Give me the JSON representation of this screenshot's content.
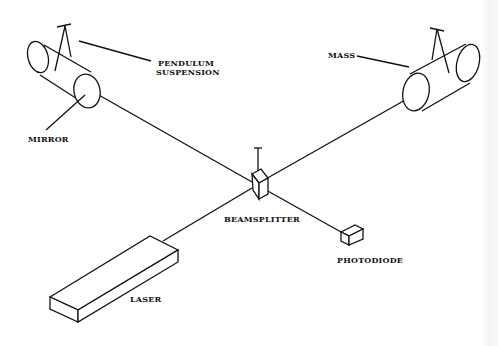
{
  "diagram": {
    "labels": {
      "pendulum_line1": "PENDULUM",
      "pendulum_line2": "SUSPENSION",
      "mirror": "MIRROR",
      "mass": "MASS",
      "beamsplitter": "BEAMSPLITTER",
      "photodiode": "PHOTODIODE",
      "laser": "LASER"
    },
    "components": [
      "mirror-mass-left",
      "mass-right",
      "beamsplitter",
      "photodiode",
      "laser"
    ],
    "colors": {
      "line": "#111111",
      "background": "#ffffff"
    }
  }
}
